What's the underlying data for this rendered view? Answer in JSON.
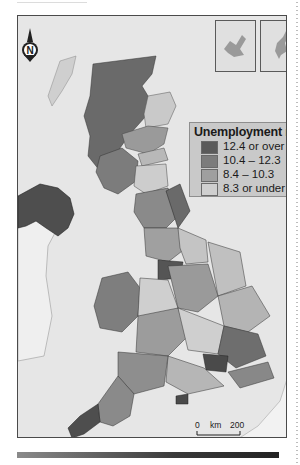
{
  "map": {
    "subject": "United Kingdom",
    "north_arrow_label": "N",
    "legend": {
      "title": "Unemployment rates",
      "items": [
        {
          "label": "12.4  or over",
          "color": "#5a5a5a"
        },
        {
          "label": "10.4  – 12.3",
          "color": "#7c7c7c"
        },
        {
          "label": "8.4  – 10.3",
          "color": "#9f9f9f"
        },
        {
          "label": "8.3  or under",
          "color": "#cfcfcf"
        }
      ]
    },
    "scale": {
      "start": "0",
      "unit": "km",
      "end": "200"
    },
    "insets": [
      "orkney-inset",
      "shetland-inset"
    ],
    "colors": {
      "sea": "#e6e6e6",
      "frame": "#4a4a4a",
      "land_bg": "#d4d4d4"
    }
  }
}
